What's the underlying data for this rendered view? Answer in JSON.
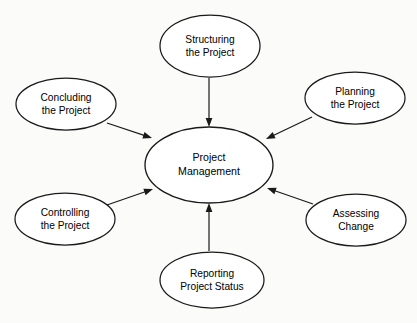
{
  "diagram": {
    "type": "hub-and-spoke",
    "background_color": "#fbfbfa",
    "stroke_color": "#1a1a1a",
    "fill_color": "#ffffff",
    "text_color": "#000000",
    "hub": {
      "id": "project-management",
      "label_line1": "Project",
      "label_line2": "Management",
      "cx": 209,
      "cy": 165,
      "rx": 64,
      "ry": 38
    },
    "nodes": [
      {
        "id": "structuring-the-project",
        "label_line1": "Structuring",
        "label_line2": "the Project",
        "cx": 210,
        "cy": 46,
        "rx": 50,
        "ry": 31,
        "position": "top"
      },
      {
        "id": "concluding-the-project",
        "label_line1": "Concluding",
        "label_line2": "the Project",
        "cx": 66,
        "cy": 104,
        "rx": 50,
        "ry": 26,
        "position": "top-left"
      },
      {
        "id": "planning-the-project",
        "label_line1": "Planning",
        "label_line2": "the Project",
        "cx": 355,
        "cy": 98,
        "rx": 50,
        "ry": 26,
        "position": "top-right"
      },
      {
        "id": "controlling-the-project",
        "label_line1": "Controlling",
        "label_line2": "the Project",
        "cx": 65,
        "cy": 219,
        "rx": 50,
        "ry": 26,
        "position": "bottom-left"
      },
      {
        "id": "assessing-change",
        "label_line1": "Assessing",
        "label_line2": "Change",
        "cx": 356,
        "cy": 220,
        "rx": 50,
        "ry": 26,
        "position": "bottom-right"
      },
      {
        "id": "reporting-project-status",
        "label_line1": "Reporting",
        "label_line2": "Project Status",
        "cx": 212,
        "cy": 280,
        "rx": 52,
        "ry": 28,
        "position": "bottom"
      }
    ],
    "arrows": [
      {
        "id": "arrow-structuring-to-hub",
        "from": "structuring-the-project",
        "to": "project-management",
        "x1": 209,
        "y1": 78,
        "x2": 209,
        "y2": 127
      },
      {
        "id": "arrow-concluding-to-hub",
        "from": "concluding-the-project",
        "to": "project-management",
        "x1": 107,
        "y1": 123,
        "x2": 152,
        "y2": 138
      },
      {
        "id": "arrow-planning-to-hub",
        "from": "planning-the-project",
        "to": "project-management",
        "x1": 312,
        "y1": 117,
        "x2": 266,
        "y2": 139
      },
      {
        "id": "arrow-controlling-to-hub",
        "from": "controlling-the-project",
        "to": "project-management",
        "x1": 107,
        "y1": 205,
        "x2": 153,
        "y2": 189
      },
      {
        "id": "arrow-assessing-to-hub",
        "from": "assessing-change",
        "to": "project-management",
        "x1": 313,
        "y1": 204,
        "x2": 267,
        "y2": 188
      },
      {
        "id": "arrow-reporting-to-hub",
        "from": "reporting-project-status",
        "to": "project-management",
        "x1": 209,
        "y1": 251,
        "x2": 209,
        "y2": 203
      }
    ]
  }
}
